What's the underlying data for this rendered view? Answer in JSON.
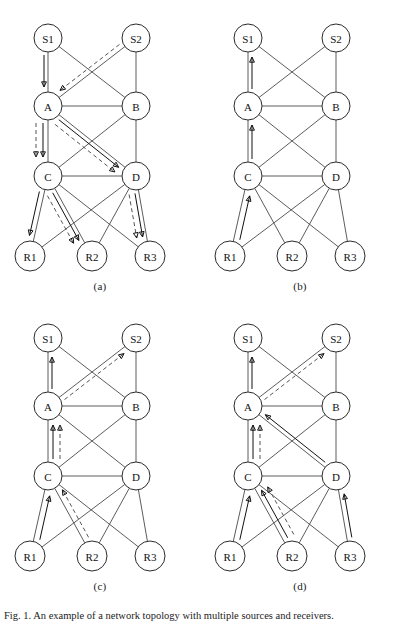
{
  "figure": {
    "width": 400,
    "height": 620,
    "caption": "Fig. 1.  An example of a network topology with multiple sources and receivers.",
    "colors": {
      "node_stroke": "#2b2b2b",
      "node_fill": "#ffffff",
      "edge": "#4a4a4a",
      "flow_solid": "#111111",
      "flow_dashed": "#555555",
      "background": "#ffffff",
      "text": "#111111"
    }
  },
  "nodes": {
    "S1": {
      "label": "S1",
      "x": 48,
      "y": 38,
      "r": 14
    },
    "S2": {
      "label": "S2",
      "x": 136,
      "y": 38,
      "r": 14
    },
    "A": {
      "label": "A",
      "x": 48,
      "y": 106,
      "r": 14
    },
    "B": {
      "label": "B",
      "x": 136,
      "y": 106,
      "r": 14
    },
    "C": {
      "label": "C",
      "x": 48,
      "y": 176,
      "r": 14
    },
    "D": {
      "label": "D",
      "x": 136,
      "y": 176,
      "r": 14
    },
    "R1": {
      "label": "R1",
      "x": 30,
      "y": 256,
      "r": 15
    },
    "R2": {
      "label": "R2",
      "x": 92,
      "y": 256,
      "r": 15
    },
    "R3": {
      "label": "R3",
      "x": 150,
      "y": 256,
      "r": 15
    }
  },
  "edges": [
    {
      "from": "S1",
      "to": "A"
    },
    {
      "from": "S1",
      "to": "B"
    },
    {
      "from": "S2",
      "to": "A"
    },
    {
      "from": "S2",
      "to": "B"
    },
    {
      "from": "A",
      "to": "B"
    },
    {
      "from": "A",
      "to": "C"
    },
    {
      "from": "A",
      "to": "D"
    },
    {
      "from": "B",
      "to": "C"
    },
    {
      "from": "B",
      "to": "D"
    },
    {
      "from": "C",
      "to": "D"
    },
    {
      "from": "C",
      "to": "R1"
    },
    {
      "from": "C",
      "to": "R2"
    },
    {
      "from": "C",
      "to": "R3"
    },
    {
      "from": "D",
      "to": "R1"
    },
    {
      "from": "D",
      "to": "R2"
    },
    {
      "from": "D",
      "to": "R3"
    }
  ],
  "panels": [
    {
      "id": "a",
      "caption": "(a)",
      "x": 0,
      "y": 0,
      "flows": [
        {
          "from": "S1",
          "to": "A",
          "style": "solid",
          "offset": 4
        },
        {
          "from": "S2",
          "to": "A",
          "style": "dashed",
          "offset": 5
        },
        {
          "from": "A",
          "to": "C",
          "style": "solid",
          "offset": 5
        },
        {
          "from": "A",
          "to": "C",
          "style": "dashed",
          "offset": 12
        },
        {
          "from": "A",
          "to": "D",
          "style": "solid",
          "offset": 4
        },
        {
          "from": "A",
          "to": "D",
          "style": "dashed",
          "offset": 10
        },
        {
          "from": "C",
          "to": "R1",
          "style": "solid",
          "offset": 5
        },
        {
          "from": "C",
          "to": "R2",
          "style": "solid",
          "offset": 4
        },
        {
          "from": "C",
          "to": "R2",
          "style": "dashed",
          "offset": 10
        },
        {
          "from": "D",
          "to": "R3",
          "style": "solid",
          "offset": 4
        },
        {
          "from": "D",
          "to": "R3",
          "style": "dashed",
          "offset": 10
        }
      ]
    },
    {
      "id": "b",
      "caption": "(b)",
      "x": 200,
      "y": 0,
      "flows": [
        {
          "from": "A",
          "to": "S1",
          "style": "solid",
          "offset": 4
        },
        {
          "from": "C",
          "to": "A",
          "style": "solid",
          "offset": 4
        },
        {
          "from": "R1",
          "to": "C",
          "style": "solid",
          "offset": 6
        }
      ]
    },
    {
      "id": "c",
      "caption": "(c)",
      "x": 0,
      "y": 300,
      "flows": [
        {
          "from": "A",
          "to": "S1",
          "style": "solid",
          "offset": 4
        },
        {
          "from": "A",
          "to": "S2",
          "style": "dashed",
          "offset": 5
        },
        {
          "from": "C",
          "to": "A",
          "style": "solid",
          "offset": 5
        },
        {
          "from": "C",
          "to": "A",
          "style": "dashed",
          "offset": 12
        },
        {
          "from": "R1",
          "to": "C",
          "style": "solid",
          "offset": 6
        },
        {
          "from": "R2",
          "to": "C",
          "style": "dashed",
          "offset": 6
        }
      ]
    },
    {
      "id": "d",
      "caption": "(d)",
      "x": 200,
      "y": 300,
      "flows": [
        {
          "from": "A",
          "to": "S1",
          "style": "solid",
          "offset": 4
        },
        {
          "from": "A",
          "to": "S2",
          "style": "dashed",
          "offset": 5
        },
        {
          "from": "C",
          "to": "A",
          "style": "solid",
          "offset": 5
        },
        {
          "from": "C",
          "to": "A",
          "style": "dashed",
          "offset": 12
        },
        {
          "from": "D",
          "to": "A",
          "style": "solid",
          "offset": 4
        },
        {
          "from": "R1",
          "to": "C",
          "style": "solid",
          "offset": 6
        },
        {
          "from": "R2",
          "to": "C",
          "style": "solid",
          "offset": 5
        },
        {
          "from": "R2",
          "to": "C",
          "style": "dashed",
          "offset": 12
        },
        {
          "from": "R3",
          "to": "D",
          "style": "solid",
          "offset": 5
        }
      ]
    }
  ]
}
